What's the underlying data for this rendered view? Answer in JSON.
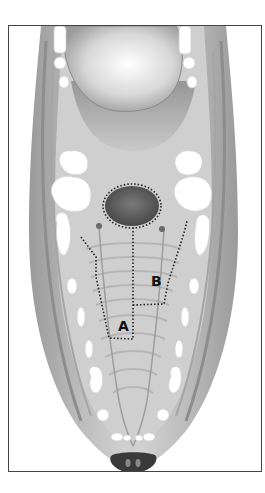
{
  "figure": {
    "labels": [
      {
        "id": "A",
        "text": "A",
        "x": 117,
        "y": 318
      },
      {
        "id": "B",
        "text": "B",
        "x": 150,
        "y": 273
      }
    ],
    "regions": [
      {
        "id": "A",
        "outline": "dotted",
        "description": "flap region A (left palatal)"
      },
      {
        "id": "B",
        "outline": "dotted",
        "description": "flap region B (right palatal)"
      },
      {
        "id": "defect",
        "outline": "dotted",
        "description": "oval palatal defect"
      }
    ],
    "colors": {
      "frame": "#444444",
      "tissue_light": "#d6d6d6",
      "tissue_mid": "#a8a8a8",
      "tissue_dark": "#6e6e6e",
      "teeth": "#ffffff",
      "defect": "#5a5a5a",
      "dots": "#222222"
    }
  }
}
